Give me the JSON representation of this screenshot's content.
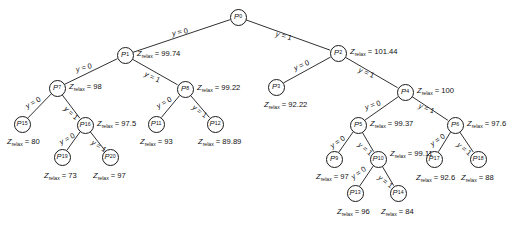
{
  "diagram": {
    "type": "tree",
    "z_symbol": "Z",
    "z_subscript": "relax",
    "node_symbol": "P",
    "edge_symbol": "y",
    "stroke_color": "#1a1a1a",
    "background_color": "#ffffff"
  },
  "nodes": [
    {
      "id": "P0",
      "index": "0",
      "x": 238,
      "y": 17,
      "z": null,
      "z_text": ""
    },
    {
      "id": "P1",
      "index": "1",
      "x": 125,
      "y": 55,
      "z": 99.74,
      "z_text": "99.74"
    },
    {
      "id": "P2",
      "index": "2",
      "x": 338,
      "y": 53,
      "z": 101.44,
      "z_text": "101.44"
    },
    {
      "id": "P7",
      "index": "7",
      "x": 57,
      "y": 88,
      "z": 98,
      "z_text": "98"
    },
    {
      "id": "P8",
      "index": "8",
      "x": 185,
      "y": 89,
      "z": 99.22,
      "z_text": "99.22"
    },
    {
      "id": "P3",
      "index": "3",
      "x": 276,
      "y": 87,
      "z": 92.22,
      "z_text": "92.22"
    },
    {
      "id": "P4",
      "index": "4",
      "x": 405,
      "y": 92,
      "z": 100,
      "z_text": "100"
    },
    {
      "id": "P15",
      "index": "15",
      "x": 22,
      "y": 124,
      "z": 80,
      "z_text": "80"
    },
    {
      "id": "P16",
      "index": "16",
      "x": 85,
      "y": 125,
      "z": 97.5,
      "z_text": "97.5"
    },
    {
      "id": "P11",
      "index": "11",
      "x": 156,
      "y": 124,
      "z": 93,
      "z_text": "93"
    },
    {
      "id": "P12",
      "index": "12",
      "x": 215,
      "y": 124,
      "z": 89.89,
      "z_text": "89.89"
    },
    {
      "id": "P19",
      "index": "19",
      "x": 62,
      "y": 157,
      "z": 73,
      "z_text": "73"
    },
    {
      "id": "P20",
      "index": "20",
      "x": 110,
      "y": 157,
      "z": 97,
      "z_text": "97"
    },
    {
      "id": "P5",
      "index": "5",
      "x": 358,
      "y": 125,
      "z": 99.37,
      "z_text": "99.37"
    },
    {
      "id": "P6",
      "index": "6",
      "x": 455,
      "y": 125,
      "z": 97.6,
      "z_text": "97.6"
    },
    {
      "id": "P9",
      "index": "9",
      "x": 334,
      "y": 159,
      "z": 97,
      "z_text": "97"
    },
    {
      "id": "P10",
      "index": "10",
      "x": 378,
      "y": 159,
      "z": 99.11,
      "z_text": "99.11"
    },
    {
      "id": "P17",
      "index": "17",
      "x": 434,
      "y": 159,
      "z": 92.6,
      "z_text": "92.6"
    },
    {
      "id": "P18",
      "index": "18",
      "x": 478,
      "y": 159,
      "z": 88,
      "z_text": "88"
    },
    {
      "id": "P13",
      "index": "13",
      "x": 355,
      "y": 193,
      "z": 96,
      "z_text": "96"
    },
    {
      "id": "P14",
      "index": "14",
      "x": 398,
      "y": 193,
      "z": 84,
      "z_text": "84"
    }
  ],
  "edges": [
    {
      "from": "P0",
      "to": "P1",
      "label_value": "0"
    },
    {
      "from": "P0",
      "to": "P2",
      "label_value": "1"
    },
    {
      "from": "P1",
      "to": "P7",
      "label_value": "0"
    },
    {
      "from": "P1",
      "to": "P8",
      "label_value": "1"
    },
    {
      "from": "P2",
      "to": "P3",
      "label_value": "0"
    },
    {
      "from": "P2",
      "to": "P4",
      "label_value": "1"
    },
    {
      "from": "P7",
      "to": "P15",
      "label_value": "0"
    },
    {
      "from": "P7",
      "to": "P16",
      "label_value": "1"
    },
    {
      "from": "P8",
      "to": "P11",
      "label_value": "0"
    },
    {
      "from": "P8",
      "to": "P12",
      "label_value": "1"
    },
    {
      "from": "P16",
      "to": "P19",
      "label_value": "0"
    },
    {
      "from": "P16",
      "to": "P20",
      "label_value": "1"
    },
    {
      "from": "P4",
      "to": "P5",
      "label_value": "0"
    },
    {
      "from": "P4",
      "to": "P6",
      "label_value": "1"
    },
    {
      "from": "P5",
      "to": "P9",
      "label_value": "0"
    },
    {
      "from": "P5",
      "to": "P10",
      "label_value": "1"
    },
    {
      "from": "P6",
      "to": "P17",
      "label_value": "0"
    },
    {
      "from": "P6",
      "to": "P18",
      "label_value": "1"
    },
    {
      "from": "P10",
      "to": "P13",
      "label_value": "0"
    },
    {
      "from": "P10",
      "to": "P14",
      "label_value": "1"
    }
  ],
  "z_labels": [
    {
      "node": "P1",
      "x": 137,
      "y": 50,
      "text": "99.74"
    },
    {
      "node": "P2",
      "x": 350,
      "y": 48,
      "text": "101.44"
    },
    {
      "node": "P7",
      "x": 69,
      "y": 83,
      "text": "98"
    },
    {
      "node": "P8",
      "x": 197,
      "y": 84,
      "text": "99.22"
    },
    {
      "node": "P3",
      "x": 264,
      "y": 101,
      "text": "92.22"
    },
    {
      "node": "P4",
      "x": 417,
      "y": 87,
      "text": "100"
    },
    {
      "node": "P15",
      "x": 7,
      "y": 138,
      "text": "80"
    },
    {
      "node": "P16",
      "x": 97,
      "y": 120,
      "text": "97.5"
    },
    {
      "node": "P11",
      "x": 140,
      "y": 138,
      "text": "93"
    },
    {
      "node": "P12",
      "x": 198,
      "y": 138,
      "text": "89.89"
    },
    {
      "node": "P19",
      "x": 44,
      "y": 172,
      "text": "73"
    },
    {
      "node": "P20",
      "x": 93,
      "y": 172,
      "text": "97"
    },
    {
      "node": "P5",
      "x": 370,
      "y": 120,
      "text": "99.37"
    },
    {
      "node": "P6",
      "x": 467,
      "y": 120,
      "text": "97.6"
    },
    {
      "node": "P9",
      "x": 316,
      "y": 173,
      "text": "97"
    },
    {
      "node": "P10",
      "x": 390,
      "y": 150,
      "text": "99.11"
    },
    {
      "node": "P17",
      "x": 416,
      "y": 174,
      "text": "92.6"
    },
    {
      "node": "P18",
      "x": 461,
      "y": 174,
      "text": "88"
    },
    {
      "node": "P13",
      "x": 337,
      "y": 208,
      "text": "96"
    },
    {
      "node": "P14",
      "x": 381,
      "y": 208,
      "text": "84"
    }
  ],
  "edge_labels": [
    {
      "edge": "P0-P1",
      "x": 172,
      "y": 30,
      "rot": -11,
      "value": "0"
    },
    {
      "edge": "P0-P2",
      "x": 276,
      "y": 30,
      "rot": 16,
      "value": "1"
    },
    {
      "edge": "P1-P7",
      "x": 76,
      "y": 66,
      "rot": -14,
      "value": "0"
    },
    {
      "edge": "P1-P8",
      "x": 145,
      "y": 70,
      "rot": 25,
      "value": "1"
    },
    {
      "edge": "P2-P3",
      "x": 294,
      "y": 65,
      "rot": -23,
      "value": "0"
    },
    {
      "edge": "P2-P4",
      "x": 359,
      "y": 66,
      "rot": 23,
      "value": "1"
    },
    {
      "edge": "P7-P15",
      "x": 26,
      "y": 103,
      "rot": -30,
      "value": "0"
    },
    {
      "edge": "P7-P16",
      "x": 65,
      "y": 104,
      "rot": 42,
      "value": "1"
    },
    {
      "edge": "P8-P11",
      "x": 157,
      "y": 103,
      "rot": -30,
      "value": "0"
    },
    {
      "edge": "P8-P12",
      "x": 193,
      "y": 103,
      "rot": 36,
      "value": "1"
    },
    {
      "edge": "P16-P19",
      "x": 60,
      "y": 139,
      "rot": -28,
      "value": "0"
    },
    {
      "edge": "P16-P20",
      "x": 92,
      "y": 138,
      "rot": 33,
      "value": "1"
    },
    {
      "edge": "P4-P5",
      "x": 365,
      "y": 104,
      "rot": -18,
      "value": "0"
    },
    {
      "edge": "P4-P6",
      "x": 419,
      "y": 102,
      "rot": 20,
      "value": "1"
    },
    {
      "edge": "P5-P9",
      "x": 331,
      "y": 143,
      "rot": -35,
      "value": "0"
    },
    {
      "edge": "P5-P10",
      "x": 359,
      "y": 140,
      "rot": 40,
      "value": "1"
    },
    {
      "edge": "P6-P17",
      "x": 431,
      "y": 141,
      "rot": -35,
      "value": "0"
    },
    {
      "edge": "P6-P18",
      "x": 458,
      "y": 140,
      "rot": 40,
      "value": "1"
    },
    {
      "edge": "P10-P13",
      "x": 352,
      "y": 174,
      "rot": -36,
      "value": "0"
    },
    {
      "edge": "P10-P14",
      "x": 379,
      "y": 173,
      "rot": 38,
      "value": "1"
    }
  ]
}
